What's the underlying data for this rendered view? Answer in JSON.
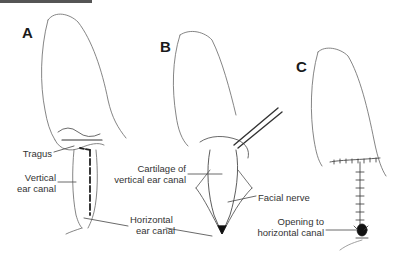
{
  "figure": {
    "panels": [
      {
        "letter": "A",
        "labels": {
          "tragus": "Tragus",
          "vertical_line1": "Vertical",
          "vertical_line2": "ear canal",
          "horizontal_line1": "Horizontal",
          "horizontal_line2": "ear canal"
        }
      },
      {
        "letter": "B",
        "labels": {
          "cartilage_line1": "Cartilage of",
          "cartilage_line2": "vertical ear canal",
          "facial_nerve": "Facial nerve"
        }
      },
      {
        "letter": "C",
        "labels": {
          "opening_line1": "Opening to",
          "opening_line2": "horizontal canal"
        }
      }
    ],
    "colors": {
      "line": "#555555",
      "label": "#333333",
      "topbar": "#555555"
    }
  }
}
